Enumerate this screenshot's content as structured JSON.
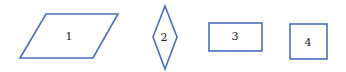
{
  "diagram": {
    "stroke_color": "#4a6dbf",
    "text_color": "#222222",
    "shapes": [
      {
        "id": "1",
        "type": "parallelogram",
        "label": "1"
      },
      {
        "id": "2",
        "type": "rhombus",
        "label": "2"
      },
      {
        "id": "3",
        "type": "rectangle",
        "label": "3"
      },
      {
        "id": "4",
        "type": "square",
        "label": "4"
      }
    ]
  }
}
